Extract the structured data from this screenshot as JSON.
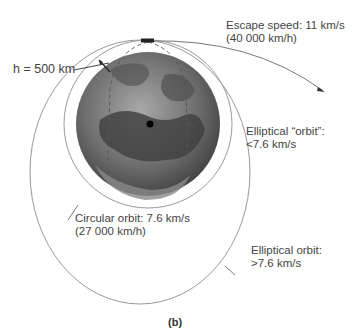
{
  "figure": {
    "caption": "(b)",
    "labels": {
      "altitude": "h = 500 km",
      "escape_line1": "Escape speed: 11 km/s",
      "escape_line2": "(40 000 km/h)",
      "elliptical_sub_line1": "Elliptical “orbit”:",
      "elliptical_sub_line2": "<7.6 km/s",
      "circular_line1": "Circular orbit: 7.6 km/s",
      "circular_line2": "(27 000 km/h)",
      "elliptical_line1": "Elliptical orbit:",
      "elliptical_line2": ">7.6 km/s"
    },
    "colors": {
      "orbit_line": "#888888",
      "earth_dark": "#3a3a3a",
      "earth_light": "#9a9a9a",
      "text": "#444444"
    }
  }
}
